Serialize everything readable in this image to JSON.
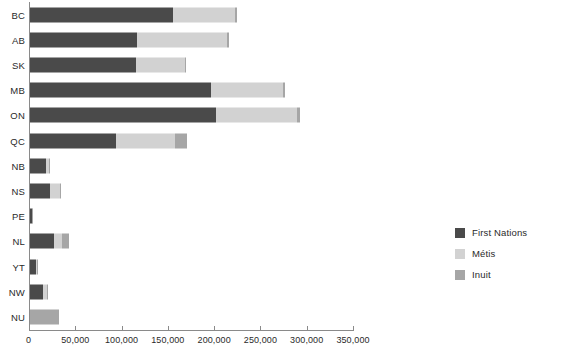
{
  "chart_data": {
    "type": "bar",
    "orientation": "horizontal",
    "stacked": true,
    "title": "",
    "subtitle": "",
    "xlabel": "",
    "ylabel": "",
    "xlim": [
      0,
      350000
    ],
    "grid": false,
    "legend_position": "right",
    "xticks": [
      0,
      50000,
      100000,
      150000,
      200000,
      250000,
      300000,
      350000
    ],
    "xtick_labels": [
      "0",
      "50,000",
      "100,000",
      "150,000",
      "200,000",
      "250,000",
      "300,000",
      "350,000"
    ],
    "categories": [
      "BC",
      "AB",
      "SK",
      "MB",
      "ON",
      "QC",
      "NB",
      "NS",
      "PE",
      "NL",
      "YT",
      "NW",
      "NU"
    ],
    "series": [
      {
        "name": "First Nations",
        "color": "#4a4a4a",
        "values": [
          155000,
          116000,
          114000,
          195000,
          201000,
          93000,
          17000,
          22000,
          2000,
          26000,
          7000,
          14000,
          0
        ]
      },
      {
        "name": "Métis",
        "color": "#d2d2d2",
        "values": [
          66000,
          97000,
          53000,
          78000,
          87000,
          64000,
          4000,
          10000,
          500,
          9000,
          1000,
          4000,
          0
        ]
      },
      {
        "name": "Inuit",
        "color": "#a6a6a6",
        "values": [
          3000,
          2000,
          1000,
          3000,
          3500,
          13000,
          700,
          1000,
          200,
          7000,
          250,
          1500,
          31000
        ]
      }
    ]
  },
  "legend": {
    "items": [
      {
        "label": "First Nations",
        "color": "#4a4a4a"
      },
      {
        "label": "Métis",
        "color": "#d2d2d2"
      },
      {
        "label": "Inuit",
        "color": "#a6a6a6"
      }
    ]
  }
}
